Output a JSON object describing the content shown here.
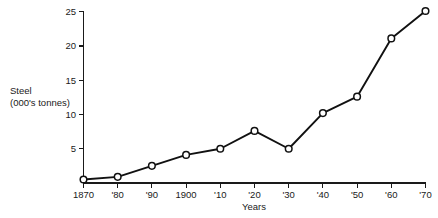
{
  "chart_data": {
    "type": "line",
    "title": "",
    "xlabel": "Years",
    "ylabel_line1": "Steel",
    "ylabel_line2": "(000's tonnes)",
    "categories": [
      "1870",
      "'80",
      "'90",
      "1900",
      "'10",
      "'20",
      "'30",
      "'40",
      "'50",
      "'60",
      "'70"
    ],
    "x_values": [
      1870,
      1880,
      1890,
      1900,
      1910,
      1920,
      1930,
      1940,
      1950,
      1960,
      1970
    ],
    "values": [
      0.5,
      0.9,
      2.5,
      4.1,
      5.0,
      7.6,
      5.0,
      10.2,
      12.6,
      21.1,
      25.1
    ],
    "y_ticks": [
      5,
      10,
      15,
      20,
      25
    ],
    "y_tick_labels": [
      "5",
      "10",
      "15",
      "20",
      "25"
    ],
    "ylim": [
      0,
      25
    ],
    "xlim": [
      1870,
      1970
    ],
    "grid": false,
    "legend": null,
    "marker": "open-circle",
    "line_color": "#111111",
    "marker_fill": "#ffffff",
    "axis_color": "#1a1a1a",
    "background": "#ffffff"
  }
}
